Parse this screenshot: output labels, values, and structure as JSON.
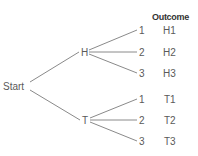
{
  "diagram": {
    "type": "probability-tree",
    "header": "Outcome",
    "root": {
      "label": "Start"
    },
    "level1": [
      {
        "label": "H"
      },
      {
        "label": "T"
      }
    ],
    "level2": [
      {
        "label": "1",
        "outcome": "H1"
      },
      {
        "label": "2",
        "outcome": "H2"
      },
      {
        "label": "3",
        "outcome": "H3"
      },
      {
        "label": "1",
        "outcome": "T1"
      },
      {
        "label": "2",
        "outcome": "T2"
      },
      {
        "label": "3",
        "outcome": "T3"
      }
    ],
    "colors": {
      "line": "#8a8a8a",
      "text": "#5a5a5a",
      "header": "#333333"
    }
  }
}
